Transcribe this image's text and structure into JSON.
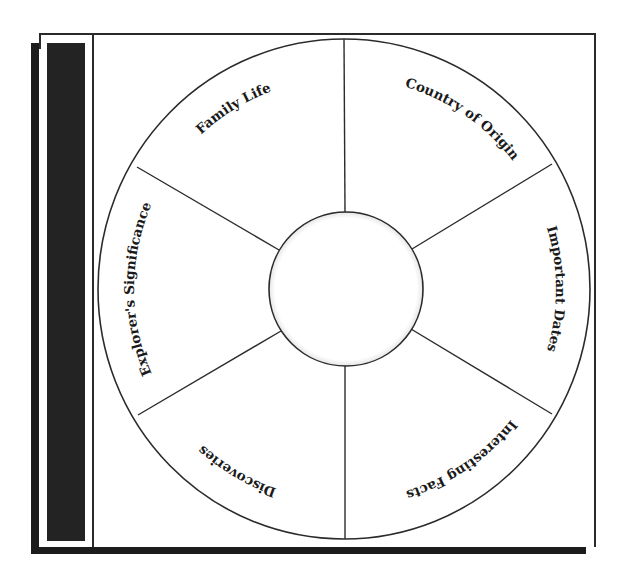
{
  "diagram": {
    "type": "graphic-organizer-wheel",
    "center_label": "",
    "sectors": [
      {
        "label": "Family Life",
        "position": "top-left"
      },
      {
        "label": "Country of Origin",
        "position": "top-right"
      },
      {
        "label": "Important Dates",
        "position": "right"
      },
      {
        "label": "Interesting Facts",
        "position": "bottom-right"
      },
      {
        "label": "Discoveries",
        "position": "bottom-left"
      },
      {
        "label": "Explorer's Significance",
        "position": "left"
      }
    ]
  },
  "colors": {
    "border": "#2a2a2a",
    "sidebar": "#232323",
    "background": "#ffffff"
  }
}
